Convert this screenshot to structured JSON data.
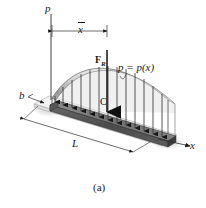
{
  "figure": {
    "caption": "(a)"
  },
  "labels": {
    "pressure_axis": "p",
    "centroid_distance": "x",
    "resultant_force": "F",
    "resultant_force_subscript": "R",
    "load_function": "p = p(x)",
    "width": "b",
    "centroid": "C",
    "length": "L",
    "x_axis": "x"
  },
  "colors": {
    "ink": "#1a1a1a",
    "line": "#3a3a3a",
    "surface_light": "#d8d8d8",
    "surface_mid": "#b4b4b4",
    "surface_dark": "#8a8a8a",
    "beam_top": "#6e6e6e",
    "beam_face": "#4a4a4a",
    "plate": "#ededed",
    "shadow": "#cfcfcf",
    "background": "#ffffff"
  },
  "geometry": {
    "plate_length_label": "L",
    "plate_width_label": "b",
    "load_arrow_count": 13,
    "curve_type": "parabolic-arch",
    "projection": "isometric"
  }
}
